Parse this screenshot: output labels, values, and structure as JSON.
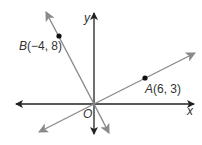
{
  "diagram": {
    "type": "coordinate-plane-lines",
    "axes": {
      "x_label": "x",
      "y_label": "y",
      "origin_label": "O",
      "axis_color": "#222222"
    },
    "lines": [
      {
        "name": "line-OB",
        "through": [
          "O",
          "B"
        ],
        "color": "#8a8a8a"
      },
      {
        "name": "line-OA",
        "through": [
          "O",
          "A"
        ],
        "color": "#8a8a8a"
      }
    ],
    "points": [
      {
        "name": "A",
        "coords": [
          6,
          3
        ],
        "label_letter": "A",
        "label_coords": "(6, 3)"
      },
      {
        "name": "B",
        "coords": [
          -4,
          8
        ],
        "label_letter": "B",
        "label_coords": "(−4, 8)"
      }
    ],
    "point_color": "#111111"
  }
}
